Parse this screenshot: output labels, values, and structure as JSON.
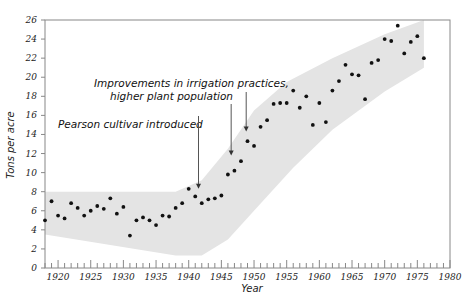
{
  "chart_data": {
    "type": "scatter",
    "title": "",
    "xlabel": "Year",
    "ylabel": "Tons per acre",
    "xlim": [
      1918,
      1980
    ],
    "ylim": [
      0,
      26
    ],
    "x_ticks": [
      1920,
      1925,
      1930,
      1935,
      1940,
      1945,
      1950,
      1955,
      1960,
      1965,
      1970,
      1975,
      1980
    ],
    "y_ticks": [
      0,
      2,
      4,
      6,
      8,
      10,
      12,
      14,
      16,
      18,
      20,
      22,
      24,
      26
    ],
    "grid": false,
    "legend": null,
    "series": [
      {
        "name": "Yield",
        "x": [
          1918,
          1919,
          1920,
          1921,
          1922,
          1923,
          1924,
          1925,
          1926,
          1927,
          1928,
          1929,
          1930,
          1931,
          1932,
          1933,
          1934,
          1935,
          1936,
          1937,
          1938,
          1939,
          1940,
          1941,
          1942,
          1943,
          1944,
          1945,
          1946,
          1947,
          1948,
          1949,
          1950,
          1951,
          1952,
          1953,
          1954,
          1955,
          1956,
          1957,
          1958,
          1959,
          1960,
          1961,
          1962,
          1963,
          1964,
          1965,
          1966,
          1967,
          1968,
          1969,
          1970,
          1971,
          1972,
          1973,
          1974,
          1975,
          1976
        ],
        "y": [
          5.0,
          7.0,
          5.5,
          5.2,
          6.8,
          6.3,
          5.5,
          6.0,
          6.5,
          6.2,
          7.3,
          5.7,
          6.4,
          3.4,
          5.0,
          5.3,
          5.0,
          4.5,
          5.5,
          5.4,
          6.3,
          6.8,
          8.3,
          7.5,
          6.8,
          7.2,
          7.3,
          7.6,
          9.8,
          10.2,
          11.2,
          13.3,
          12.8,
          14.8,
          15.5,
          17.2,
          17.3,
          17.3,
          18.6,
          16.8,
          18.0,
          15.0,
          17.3,
          15.3,
          18.6,
          19.6,
          21.3,
          20.3,
          20.2,
          17.7,
          21.5,
          21.8,
          24.0,
          23.8,
          25.4,
          22.5,
          23.7,
          24.3,
          22.0
        ]
      }
    ],
    "band": {
      "description": "Shaded trend band",
      "color": "#e4e4e4",
      "upper": [
        [
          1918,
          8.0
        ],
        [
          1938,
          8.0
        ],
        [
          1942,
          9.2
        ],
        [
          1946,
          12.5
        ],
        [
          1950,
          16.5
        ],
        [
          1955,
          19.5
        ],
        [
          1962,
          22.0
        ],
        [
          1970,
          24.5
        ],
        [
          1976,
          26.0
        ]
      ],
      "lower": [
        [
          1976,
          21.0
        ],
        [
          1970,
          18.5
        ],
        [
          1962,
          14.5
        ],
        [
          1956,
          10.5
        ],
        [
          1950,
          6.0
        ],
        [
          1946,
          3.0
        ],
        [
          1942,
          1.3
        ],
        [
          1938,
          1.3
        ],
        [
          1918,
          3.5
        ]
      ]
    },
    "annotations": [
      {
        "text": "Pearson cultivar introduced",
        "arrow_year": 1941.5,
        "arrow_to": 8.3
      },
      {
        "text_lines": [
          "Improvements in irrigation practices,",
          "higher plant population"
        ],
        "arrow_year_1": 1946.5,
        "arrow_to_1": 11.8,
        "arrow_year_2": 1948.8,
        "arrow_to_2": 14.3
      }
    ]
  },
  "colors": {
    "band": "#e4e4e4",
    "point": "#111111",
    "axis": "#888888",
    "text": "#222222"
  }
}
